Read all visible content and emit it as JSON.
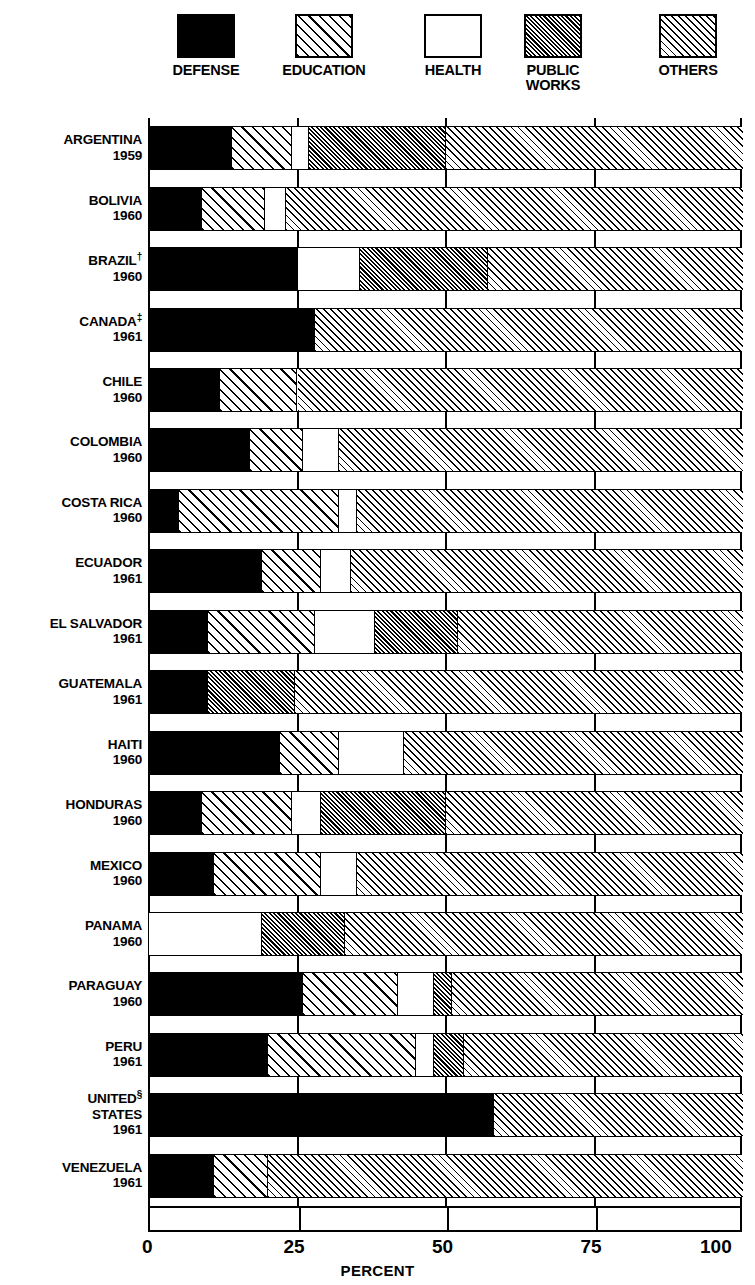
{
  "legend": {
    "items": [
      {
        "label": "DEFENSE",
        "key": "defense",
        "pattern": "solid-black"
      },
      {
        "label": "EDUCATION",
        "key": "education",
        "pattern": "wide-diagonal-hatch"
      },
      {
        "label": "HEALTH",
        "key": "health",
        "pattern": "white-blank"
      },
      {
        "label": "PUBLIC\nWORKS",
        "key": "public",
        "pattern": "dense-diagonal-hatch"
      },
      {
        "label": "OTHERS",
        "key": "others",
        "pattern": "cross-hatch"
      }
    ]
  },
  "axis": {
    "x_title": "PERCENT",
    "x_ticks": [
      "0",
      "25",
      "50",
      "75",
      "100"
    ],
    "x_tick_values": [
      0,
      25,
      50,
      75,
      100
    ],
    "x_min": 0,
    "x_max": 100
  },
  "chart_data": {
    "type": "bar",
    "orientation": "horizontal",
    "stacked": true,
    "title": "",
    "xlabel": "PERCENT",
    "ylabel": "",
    "xlim": [
      0,
      100
    ],
    "grid": true,
    "legend_position": "top",
    "series": [
      {
        "name": "DEFENSE",
        "values": [
          14,
          9,
          25,
          28,
          12,
          17,
          5,
          19,
          10,
          10,
          22,
          9,
          11,
          0,
          26,
          20,
          58,
          11
        ]
      },
      {
        "name": "EDUCATION",
        "values": [
          10,
          10.5,
          0,
          0,
          13,
          9,
          27,
          10,
          18,
          0,
          10,
          15,
          18,
          0,
          16,
          25,
          0,
          9
        ]
      },
      {
        "name": "HEALTH",
        "values": [
          3,
          3.5,
          10.5,
          0,
          0,
          6,
          3,
          5,
          10,
          0,
          11,
          5,
          6,
          19,
          6,
          3,
          0,
          0
        ]
      },
      {
        "name": "PUBLIC WORKS",
        "values": [
          23,
          0,
          21.5,
          0,
          0,
          0,
          0,
          0,
          14,
          14.5,
          0,
          21,
          0,
          14,
          3,
          5,
          0,
          0
        ]
      },
      {
        "name": "OTHERS",
        "values": [
          50,
          77,
          43,
          72,
          75,
          68,
          65,
          66,
          48,
          75.5,
          57,
          50,
          65,
          67,
          49,
          47,
          42,
          80
        ]
      }
    ],
    "categories": [
      {
        "country": "ARGENTINA",
        "year": "1959",
        "footnote": ""
      },
      {
        "country": "BOLIVIA",
        "year": "1960",
        "footnote": ""
      },
      {
        "country": "BRAZIL",
        "year": "1960",
        "footnote": "†"
      },
      {
        "country": "CANADA",
        "year": "1961",
        "footnote": "‡"
      },
      {
        "country": "CHILE",
        "year": "1960",
        "footnote": ""
      },
      {
        "country": "COLOMBIA",
        "year": "1960",
        "footnote": ""
      },
      {
        "country": "COSTA RICA",
        "year": "1960",
        "footnote": ""
      },
      {
        "country": "ECUADOR",
        "year": "1961",
        "footnote": ""
      },
      {
        "country": "EL SALVADOR",
        "year": "1961",
        "footnote": ""
      },
      {
        "country": "GUATEMALA",
        "year": "1961",
        "footnote": ""
      },
      {
        "country": "HAITI",
        "year": "1960",
        "footnote": ""
      },
      {
        "country": "HONDURAS",
        "year": "1960",
        "footnote": ""
      },
      {
        "country": "MEXICO",
        "year": "1960",
        "footnote": ""
      },
      {
        "country": "PANAMA",
        "year": "1960",
        "footnote": ""
      },
      {
        "country": "PARAGUAY",
        "year": "1960",
        "footnote": ""
      },
      {
        "country": "PERU",
        "year": "1961",
        "footnote": ""
      },
      {
        "country": "UNITED STATES",
        "year": "1961",
        "footnote": "§"
      },
      {
        "country": "VENEZUELA",
        "year": "1961",
        "footnote": ""
      }
    ]
  },
  "colors": {
    "ink": "#000000",
    "paper": "#ffffff"
  }
}
